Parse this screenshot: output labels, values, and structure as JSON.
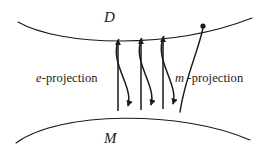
{
  "figure": {
    "kind": "information-geometry-projection-diagram",
    "background_color": "#ffffff",
    "stroke_color": "#1a1a1a",
    "labels": {
      "top_manifold": "D",
      "bottom_manifold": "M",
      "left_projection_symbol": "e",
      "left_projection_rest": "-projection",
      "right_projection_symbol": "m",
      "right_projection_rest": " -projection",
      "left_projection_full": "e-projection",
      "right_projection_full": "m -projection"
    },
    "curves": {
      "top_manifold_shape": "arc opening upward (concave up)",
      "bottom_manifold_shape": "arc opening downward (convex up)",
      "top_manifold_path": "M 18 22 C 60 46, 170 50, 252 18",
      "bottom_manifold_path": "M 16 143 C 60 111, 180 110, 250 140"
    },
    "marker_point": {
      "name": "point-on-D",
      "x": 203,
      "y": 26,
      "radius": 2.6
    },
    "arrow_pairs": [
      {
        "index": 1,
        "up_arrow_path": "M 118 111 L 118 40",
        "down_arrow_path": "M 119 39 C 108 62, 134 86, 128 106"
      },
      {
        "index": 2,
        "up_arrow_path": "M 141 110 L 141 39",
        "down_arrow_path": "M 142 38 C 131 61, 157 85, 151 105"
      },
      {
        "index": 3,
        "up_arrow_path": "M 163 109 L 163 37",
        "down_arrow_path": "M 164 36 C 153 59, 179 84, 173 104"
      }
    ],
    "descending_curve": {
      "name": "curve-from-point-to-M",
      "path": "M 203 28 C 198 52, 185 78, 180 112"
    },
    "arrowhead": {
      "style": "solid filled triangle",
      "width": 6,
      "length": 9
    }
  }
}
